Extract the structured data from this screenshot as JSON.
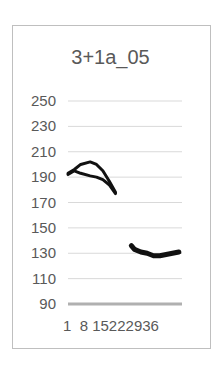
{
  "chart_data": {
    "type": "line",
    "title": "3+1a_05",
    "xlabel": "",
    "ylabel": "",
    "ylim": [
      90,
      250
    ],
    "yticks": [
      250,
      230,
      210,
      190,
      170,
      150,
      130,
      110,
      90
    ],
    "xtick_labels": [
      "1",
      "8",
      "15",
      "22",
      "29",
      "36"
    ],
    "grid": true,
    "legend": null,
    "series": [
      {
        "name": "upper-arc",
        "x": [
          1,
          3,
          5,
          8,
          10,
          12,
          14,
          16
        ],
        "values": [
          193,
          196,
          200,
          202,
          200,
          195,
          187,
          178
        ]
      },
      {
        "name": "upper-lower",
        "x": [
          1,
          3,
          5,
          8,
          10,
          12,
          14,
          16
        ],
        "values": [
          192,
          195,
          193,
          191,
          190,
          188,
          184,
          177
        ]
      },
      {
        "name": "lower",
        "x": [
          21,
          22,
          24,
          26,
          28,
          30,
          32,
          34,
          36
        ],
        "values": [
          136,
          133,
          131,
          130,
          128,
          128,
          129,
          130,
          131
        ]
      }
    ]
  }
}
